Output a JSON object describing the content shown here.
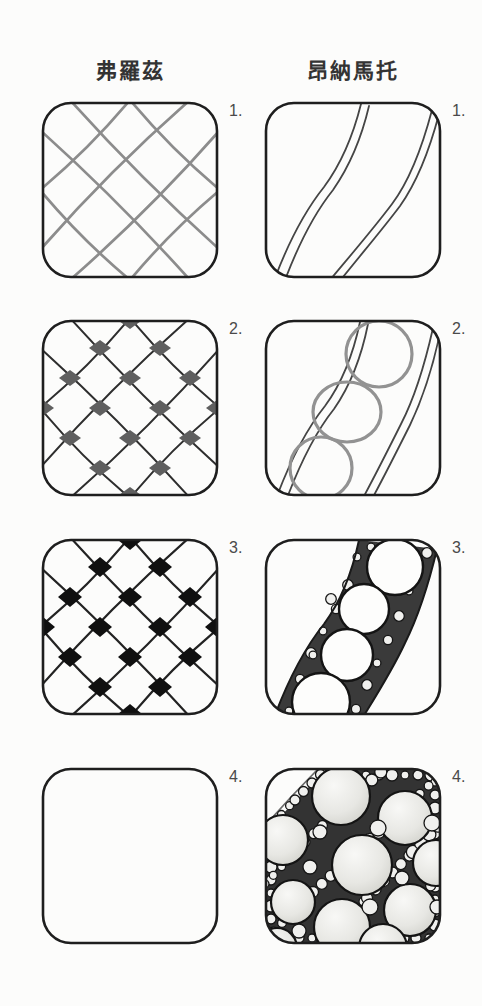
{
  "page": {
    "background": "#fcfcfb"
  },
  "colors": {
    "paper": "#fcfcfb",
    "border": "#1e1e1e",
    "label": "#333333",
    "gray_line": "#8c8c8c",
    "dark_line": "#2e2e2e",
    "diamond_gray": "#5f5f5f",
    "diamond_black": "#101010",
    "band_edge": "#454545",
    "band_fill": "#3a3a3a",
    "circle_gray": "#929292",
    "pearl_fill": "#f0f0ee",
    "pattern_dark": "#333333"
  },
  "columns": [
    {
      "title": "弗羅茲",
      "steps": [
        {
          "label": "1."
        },
        {
          "label": "2."
        },
        {
          "label": "3."
        },
        {
          "label": "4."
        }
      ]
    },
    {
      "title": "昂納馬托",
      "steps": [
        {
          "label": "1."
        },
        {
          "label": "2."
        },
        {
          "label": "3."
        },
        {
          "label": "4."
        }
      ]
    }
  ]
}
